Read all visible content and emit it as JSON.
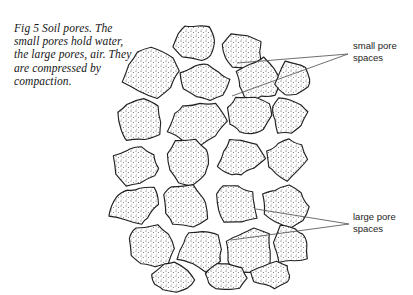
{
  "figure": {
    "caption": "Fig 5   Soil pores. The small pores hold water, the large pores, air. They are compressed by compaction.",
    "caption_number": "Fig 5"
  },
  "labels": {
    "small_pore": "small pore\nspaces",
    "large_pore": "large pore\nspaces"
  },
  "colors": {
    "background": "#ffffff",
    "ink": "#1a1a1a",
    "outline": "#222222",
    "stipple": "#4a4a4a",
    "leader": "#555555"
  },
  "diagram": {
    "type": "line-drawing",
    "particles": [
      {
        "cx": 195,
        "cy": 40,
        "rx": 22,
        "ry": 19,
        "seed": 1
      },
      {
        "cx": 243,
        "cy": 52,
        "rx": 21,
        "ry": 18,
        "seed": 2
      },
      {
        "cx": 150,
        "cy": 73,
        "rx": 26,
        "ry": 23,
        "seed": 3
      },
      {
        "cx": 205,
        "cy": 82,
        "rx": 24,
        "ry": 20,
        "seed": 4
      },
      {
        "cx": 258,
        "cy": 80,
        "rx": 25,
        "ry": 22,
        "seed": 5
      },
      {
        "cx": 293,
        "cy": 78,
        "rx": 19,
        "ry": 17,
        "seed": 6
      },
      {
        "cx": 141,
        "cy": 122,
        "rx": 25,
        "ry": 23,
        "seed": 7
      },
      {
        "cx": 196,
        "cy": 122,
        "rx": 28,
        "ry": 24,
        "seed": 8
      },
      {
        "cx": 249,
        "cy": 117,
        "rx": 22,
        "ry": 21,
        "seed": 9
      },
      {
        "cx": 289,
        "cy": 114,
        "rx": 20,
        "ry": 19,
        "seed": 10
      },
      {
        "cx": 138,
        "cy": 166,
        "rx": 24,
        "ry": 21,
        "seed": 11
      },
      {
        "cx": 189,
        "cy": 163,
        "rx": 25,
        "ry": 22,
        "seed": 12
      },
      {
        "cx": 240,
        "cy": 158,
        "rx": 23,
        "ry": 20,
        "seed": 13
      },
      {
        "cx": 286,
        "cy": 160,
        "rx": 21,
        "ry": 20,
        "seed": 14
      },
      {
        "cx": 135,
        "cy": 206,
        "rx": 25,
        "ry": 22,
        "seed": 15
      },
      {
        "cx": 186,
        "cy": 205,
        "rx": 23,
        "ry": 21,
        "seed": 16
      },
      {
        "cx": 236,
        "cy": 203,
        "rx": 24,
        "ry": 22,
        "seed": 17
      },
      {
        "cx": 285,
        "cy": 205,
        "rx": 22,
        "ry": 21,
        "seed": 18
      },
      {
        "cx": 150,
        "cy": 248,
        "rx": 24,
        "ry": 21,
        "seed": 19
      },
      {
        "cx": 200,
        "cy": 250,
        "rx": 23,
        "ry": 20,
        "seed": 20
      },
      {
        "cx": 249,
        "cy": 252,
        "rx": 25,
        "ry": 22,
        "seed": 21
      },
      {
        "cx": 291,
        "cy": 246,
        "rx": 21,
        "ry": 20,
        "seed": 22
      },
      {
        "cx": 173,
        "cy": 278,
        "rx": 20,
        "ry": 15,
        "seed": 23
      },
      {
        "cx": 225,
        "cy": 277,
        "rx": 22,
        "ry": 16,
        "seed": 24
      },
      {
        "cx": 272,
        "cy": 275,
        "rx": 19,
        "ry": 14,
        "seed": 25
      }
    ],
    "leaders": {
      "small": [
        {
          "x1": 348,
          "y1": 54,
          "x2": 237,
          "y2": 63
        },
        {
          "x1": 348,
          "y1": 54,
          "x2": 232,
          "y2": 96
        }
      ],
      "large": [
        {
          "x1": 349,
          "y1": 224,
          "x2": 256,
          "y2": 209
        },
        {
          "x1": 349,
          "y1": 224,
          "x2": 231,
          "y2": 240
        }
      ]
    }
  }
}
